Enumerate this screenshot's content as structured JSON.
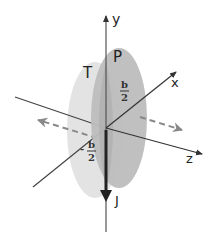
{
  "diagram": {
    "axes": {
      "x": {
        "label": "x"
      },
      "y": {
        "label": "y"
      },
      "z": {
        "label": "z"
      }
    },
    "planes": [
      {
        "id": "T",
        "label": "T",
        "color": "#e2e2e2"
      },
      {
        "id": "P",
        "label": "P",
        "color": "#b9b9b9"
      }
    ],
    "current": {
      "label": "J",
      "direction": "down (-y)"
    },
    "annotations": {
      "plus_half": {
        "numerator": "b",
        "denominator": "2",
        "sign": ""
      },
      "minus_half": {
        "numerator": "b",
        "denominator": "2",
        "sign": "-"
      }
    },
    "field_arrows": [
      {
        "direction": "toward -z",
        "style": "dashed"
      },
      {
        "direction": "toward +z",
        "style": "dashed"
      }
    ],
    "colors": {
      "axis": "#444444",
      "dashed": "#777777",
      "current": "#222222"
    }
  }
}
